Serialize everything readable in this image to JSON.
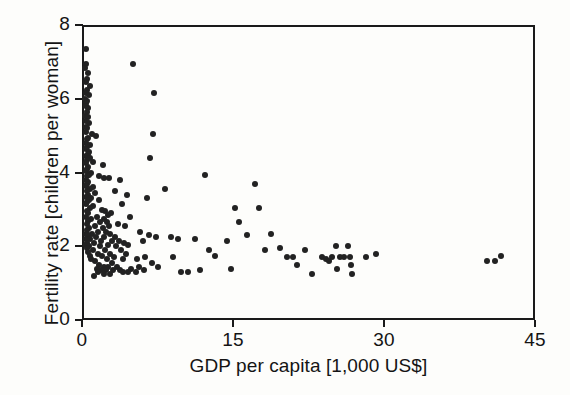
{
  "chart_data": {
    "type": "scatter",
    "title": "",
    "xlabel": "GDP per capita [1,000 US$]",
    "ylabel": "Fertility rate [children per woman]",
    "xlim": [
      0,
      45
    ],
    "ylim": [
      0,
      8
    ],
    "xticks": [
      0,
      15,
      30,
      45
    ],
    "xticklabels": [
      "0",
      "15",
      "30",
      "45"
    ],
    "yticks": [
      0,
      2,
      4,
      6,
      8
    ],
    "yticklabels": [
      "0",
      "2",
      "4",
      "6",
      "8"
    ],
    "grid": false,
    "legend": null,
    "marker_color": "#222222",
    "axis_color": "#1a1a1a",
    "points": [
      [
        0.15,
        7.4
      ],
      [
        0.2,
        7.0
      ],
      [
        0.1,
        6.9
      ],
      [
        0.35,
        6.75
      ],
      [
        0.25,
        6.6
      ],
      [
        0.15,
        6.5
      ],
      [
        0.55,
        6.4
      ],
      [
        0.3,
        6.3
      ],
      [
        0.2,
        6.2
      ],
      [
        0.45,
        6.15
      ],
      [
        0.1,
        6.05
      ],
      [
        0.3,
        6.0
      ],
      [
        0.2,
        5.95
      ],
      [
        0.15,
        5.85
      ],
      [
        0.4,
        5.8
      ],
      [
        0.25,
        5.7
      ],
      [
        0.1,
        5.6
      ],
      [
        0.35,
        5.55
      ],
      [
        0.2,
        5.45
      ],
      [
        0.5,
        5.4
      ],
      [
        0.15,
        5.3
      ],
      [
        0.3,
        5.25
      ],
      [
        0.2,
        5.15
      ],
      [
        0.75,
        5.1
      ],
      [
        1.15,
        5.05
      ],
      [
        0.4,
        5.0
      ],
      [
        0.25,
        4.95
      ],
      [
        0.15,
        4.85
      ],
      [
        0.55,
        4.8
      ],
      [
        0.3,
        4.75
      ],
      [
        0.2,
        4.7
      ],
      [
        0.45,
        4.6
      ],
      [
        0.35,
        4.55
      ],
      [
        0.15,
        4.5
      ],
      [
        0.6,
        4.45
      ],
      [
        0.25,
        4.4
      ],
      [
        0.9,
        4.35
      ],
      [
        0.2,
        4.3
      ],
      [
        0.4,
        4.2
      ],
      [
        0.3,
        4.15
      ],
      [
        0.15,
        4.1
      ],
      [
        0.7,
        4.05
      ],
      [
        0.5,
        4.0
      ],
      [
        0.25,
        3.95
      ],
      [
        1.5,
        3.95
      ],
      [
        1.95,
        3.9
      ],
      [
        0.2,
        3.85
      ],
      [
        0.4,
        3.8
      ],
      [
        0.3,
        3.75
      ],
      [
        0.15,
        3.7
      ],
      [
        0.85,
        3.65
      ],
      [
        0.55,
        3.6
      ],
      [
        0.25,
        3.55
      ],
      [
        1.1,
        3.5
      ],
      [
        0.35,
        3.45
      ],
      [
        0.2,
        3.4
      ],
      [
        0.65,
        3.35
      ],
      [
        0.45,
        3.3
      ],
      [
        1.45,
        3.3
      ],
      [
        0.3,
        3.25
      ],
      [
        0.15,
        3.2
      ],
      [
        0.9,
        3.15
      ],
      [
        0.55,
        3.1
      ],
      [
        1.75,
        3.05
      ],
      [
        0.25,
        3.0
      ],
      [
        2.1,
        3.0
      ],
      [
        0.4,
        2.95
      ],
      [
        2.4,
        2.9
      ],
      [
        0.2,
        2.85
      ],
      [
        1.3,
        2.85
      ],
      [
        0.7,
        2.8
      ],
      [
        2.0,
        2.8
      ],
      [
        0.35,
        2.75
      ],
      [
        1.6,
        2.7
      ],
      [
        2.3,
        2.7
      ],
      [
        0.25,
        2.65
      ],
      [
        1.1,
        2.6
      ],
      [
        2.5,
        2.6
      ],
      [
        0.5,
        2.55
      ],
      [
        1.85,
        2.55
      ],
      [
        0.3,
        2.5
      ],
      [
        1.4,
        2.45
      ],
      [
        2.2,
        2.45
      ],
      [
        0.15,
        2.4
      ],
      [
        0.8,
        2.4
      ],
      [
        2.6,
        2.4
      ],
      [
        0.4,
        2.35
      ],
      [
        1.2,
        2.3
      ],
      [
        2.0,
        2.3
      ],
      [
        3.1,
        2.3
      ],
      [
        0.2,
        2.25
      ],
      [
        0.6,
        2.25
      ],
      [
        1.7,
        2.2
      ],
      [
        2.8,
        2.2
      ],
      [
        3.5,
        2.2
      ],
      [
        0.3,
        2.15
      ],
      [
        1.0,
        2.15
      ],
      [
        2.35,
        2.1
      ],
      [
        4.0,
        2.15
      ],
      [
        0.15,
        2.1
      ],
      [
        0.45,
        2.05
      ],
      [
        1.55,
        2.05
      ],
      [
        3.2,
        2.05
      ],
      [
        4.4,
        2.1
      ],
      [
        0.25,
        2.0
      ],
      [
        0.9,
        1.95
      ],
      [
        2.1,
        1.95
      ],
      [
        3.7,
        1.95
      ],
      [
        0.35,
        1.9
      ],
      [
        1.35,
        1.85
      ],
      [
        2.6,
        1.85
      ],
      [
        4.2,
        1.85
      ],
      [
        0.55,
        1.8
      ],
      [
        1.8,
        1.8
      ],
      [
        3.0,
        1.75
      ],
      [
        0.7,
        1.7
      ],
      [
        2.3,
        1.7
      ],
      [
        3.9,
        1.7
      ],
      [
        1.1,
        1.65
      ],
      [
        2.8,
        1.6
      ],
      [
        1.5,
        1.55
      ],
      [
        2.0,
        1.5
      ],
      [
        2.4,
        1.5
      ],
      [
        3.3,
        1.5
      ],
      [
        1.25,
        1.45
      ],
      [
        1.7,
        1.4
      ],
      [
        2.15,
        1.4
      ],
      [
        2.9,
        1.4
      ],
      [
        3.6,
        1.4
      ],
      [
        1.4,
        1.35
      ],
      [
        1.95,
        1.3
      ],
      [
        2.55,
        1.3
      ],
      [
        0.95,
        1.25
      ],
      [
        4.9,
        7.0
      ],
      [
        7.0,
        6.2
      ],
      [
        6.9,
        5.1
      ],
      [
        6.6,
        4.45
      ],
      [
        8.0,
        3.6
      ],
      [
        6.3,
        3.35
      ],
      [
        5.6,
        2.45
      ],
      [
        6.5,
        2.35
      ],
      [
        7.2,
        2.3
      ],
      [
        5.9,
        2.2
      ],
      [
        6.1,
        1.75
      ],
      [
        5.3,
        1.7
      ],
      [
        6.8,
        1.6
      ],
      [
        5.5,
        1.5
      ],
      [
        7.4,
        1.5
      ],
      [
        6.0,
        1.4
      ],
      [
        5.2,
        1.35
      ],
      [
        8.6,
        2.3
      ],
      [
        9.3,
        2.25
      ],
      [
        8.8,
        1.75
      ],
      [
        9.6,
        1.35
      ],
      [
        10.3,
        1.35
      ],
      [
        11.0,
        2.25
      ],
      [
        11.5,
        1.4
      ],
      [
        12.0,
        4.0
      ],
      [
        12.4,
        1.95
      ],
      [
        13.0,
        1.8
      ],
      [
        14.2,
        2.2
      ],
      [
        14.6,
        1.45
      ],
      [
        15.0,
        3.1
      ],
      [
        15.4,
        2.7
      ],
      [
        16.2,
        2.35
      ],
      [
        17.0,
        3.75
      ],
      [
        17.4,
        3.1
      ],
      [
        18.0,
        1.95
      ],
      [
        18.6,
        2.4
      ],
      [
        19.5,
        2.0
      ],
      [
        20.2,
        1.75
      ],
      [
        20.8,
        1.75
      ],
      [
        21.2,
        1.55
      ],
      [
        22.0,
        1.95
      ],
      [
        22.6,
        1.3
      ],
      [
        23.6,
        1.75
      ],
      [
        24.0,
        1.7
      ],
      [
        24.3,
        1.65
      ],
      [
        24.6,
        1.75
      ],
      [
        25.0,
        2.05
      ],
      [
        25.1,
        1.45
      ],
      [
        25.4,
        1.75
      ],
      [
        25.8,
        1.75
      ],
      [
        26.2,
        2.05
      ],
      [
        26.4,
        1.75
      ],
      [
        26.5,
        1.55
      ],
      [
        26.6,
        1.3
      ],
      [
        28.0,
        1.75
      ],
      [
        29.0,
        1.85
      ],
      [
        40.0,
        1.65
      ],
      [
        40.8,
        1.65
      ],
      [
        41.4,
        1.8
      ],
      [
        3.4,
        2.65
      ],
      [
        4.1,
        2.6
      ],
      [
        4.6,
        2.85
      ],
      [
        3.8,
        3.2
      ],
      [
        4.3,
        3.45
      ],
      [
        3.6,
        3.85
      ],
      [
        4.7,
        1.45
      ],
      [
        4.4,
        1.35
      ],
      [
        3.9,
        1.35
      ],
      [
        2.7,
        2.95
      ],
      [
        3.05,
        3.55
      ],
      [
        2.45,
        3.9
      ],
      [
        1.85,
        4.25
      ]
    ]
  }
}
